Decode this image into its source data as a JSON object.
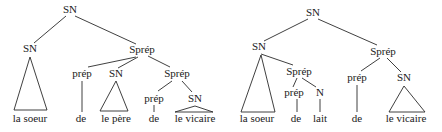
{
  "diagram": {
    "type": "syntax-tree-pair",
    "trees": [
      {
        "id": "left",
        "nodes": [
          {
            "id": "root",
            "label": "SN",
            "x": 70,
            "y": 13
          },
          {
            "id": "sn1",
            "label": "SN",
            "x": 30,
            "y": 52
          },
          {
            "id": "sprep1",
            "label": "Sprép",
            "x": 142,
            "y": 53
          },
          {
            "id": "prep1",
            "label": "prép",
            "x": 82,
            "y": 77
          },
          {
            "id": "sn2",
            "label": "SN",
            "x": 116,
            "y": 77
          },
          {
            "id": "sprep2",
            "label": "Sprép",
            "x": 177,
            "y": 77
          },
          {
            "id": "prep2",
            "label": "prép",
            "x": 154,
            "y": 102
          },
          {
            "id": "sn3",
            "label": "SN",
            "x": 195,
            "y": 102
          }
        ],
        "leaves": [
          {
            "text": "la soeur",
            "x": 30,
            "y": 121
          },
          {
            "text": "de",
            "x": 81,
            "y": 121
          },
          {
            "text": "le père",
            "x": 116,
            "y": 121
          },
          {
            "text": "de",
            "x": 154,
            "y": 121
          },
          {
            "text": "le vicaire",
            "x": 195,
            "y": 121
          }
        ]
      },
      {
        "id": "right",
        "nodes": [
          {
            "id": "root",
            "label": "SN",
            "x": 313,
            "y": 16
          },
          {
            "id": "sn1",
            "label": "SN",
            "x": 261,
            "y": 50
          },
          {
            "id": "sprep1",
            "label": "Sprép",
            "x": 299,
            "y": 75
          },
          {
            "id": "prep1",
            "label": "prép",
            "x": 297,
            "y": 96
          },
          {
            "id": "n1",
            "label": "N",
            "x": 320,
            "y": 96
          },
          {
            "id": "sprep2",
            "label": "Sprép",
            "x": 383,
            "y": 55
          },
          {
            "id": "prep2",
            "label": "prép",
            "x": 357,
            "y": 81
          },
          {
            "id": "sn2",
            "label": "SN",
            "x": 404,
            "y": 81
          }
        ],
        "leaves": [
          {
            "text": "la soeur",
            "x": 258,
            "y": 121
          },
          {
            "text": "de",
            "x": 297,
            "y": 121
          },
          {
            "text": "lait",
            "x": 320,
            "y": 121
          },
          {
            "text": "de",
            "x": 357,
            "y": 121
          },
          {
            "text": "le vicaire",
            "x": 405,
            "y": 121
          }
        ]
      }
    ]
  },
  "labels": {
    "SN": "SN",
    "Sprep": "Sprép",
    "prep": "prép",
    "N": "N",
    "la_soeur": "la soeur",
    "de": "de",
    "le_pere": "le père",
    "le_vicaire": "le vicaire",
    "lait": "lait"
  }
}
